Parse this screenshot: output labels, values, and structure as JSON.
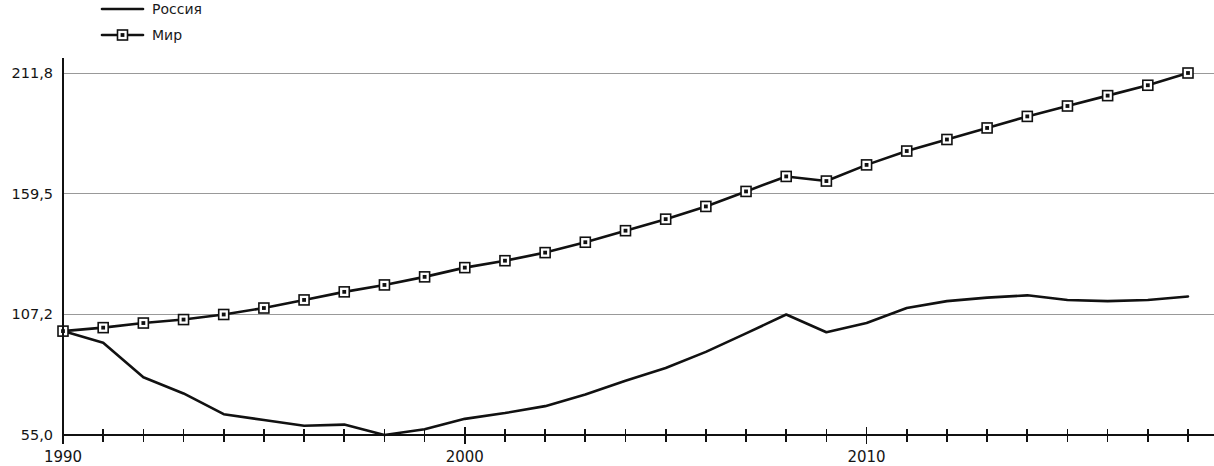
{
  "legend": {
    "position": "top-left",
    "entries": [
      {
        "label": "Россия",
        "marker": "line",
        "color": "#111111"
      },
      {
        "label": "Мир",
        "marker": "line-square",
        "color": "#111111"
      }
    ]
  },
  "axes": {
    "y_ticks": [
      "211,8",
      "159,5",
      "107,2",
      "55,0"
    ],
    "x_ticks_labeled": [
      "1990",
      "2000",
      "2010"
    ]
  },
  "chart_data": {
    "type": "line",
    "title": "",
    "subtitle": "",
    "xlabel": "",
    "ylabel": "",
    "grid": true,
    "legend_position": "top-left",
    "xlim": [
      1990,
      2018
    ],
    "ylim": [
      55.0,
      211.8
    ],
    "y_tick_values": [
      55.0,
      107.2,
      159.5,
      211.8
    ],
    "y_tick_labels": [
      "55,0",
      "107,2",
      "159,5",
      "211,8"
    ],
    "x_tick_values": [
      1990,
      1991,
      1992,
      1993,
      1994,
      1995,
      1996,
      1997,
      1998,
      1999,
      2000,
      2001,
      2002,
      2003,
      2004,
      2005,
      2006,
      2007,
      2008,
      2009,
      2010,
      2011,
      2012,
      2013,
      2014,
      2015,
      2016,
      2017,
      2018
    ],
    "x_tick_labels": {
      "1990": "1990",
      "2000": "2000",
      "2010": "2010"
    },
    "x": [
      1990,
      1991,
      1992,
      1993,
      1994,
      1995,
      1996,
      1997,
      1998,
      1999,
      2000,
      2001,
      2002,
      2003,
      2004,
      2005,
      2006,
      2007,
      2008,
      2009,
      2010,
      2011,
      2012,
      2013,
      2014,
      2015,
      2016,
      2017,
      2018
    ],
    "series": [
      {
        "name": "Россия",
        "marker": "none",
        "values": [
          100.0,
          95.0,
          80.0,
          73.0,
          64.0,
          61.5,
          59.0,
          59.5,
          55.0,
          57.5,
          62.0,
          64.5,
          67.5,
          72.5,
          78.5,
          84.0,
          91.0,
          99.0,
          107.2,
          99.5,
          103.5,
          110.0,
          113.0,
          114.5,
          115.5,
          113.5,
          113.0,
          113.5,
          115.0
        ]
      },
      {
        "name": "Мир",
        "marker": "square",
        "values": [
          100.0,
          101.5,
          103.5,
          105.0,
          107.2,
          110.0,
          113.5,
          117.0,
          120.0,
          123.5,
          127.5,
          130.5,
          134.0,
          138.5,
          143.5,
          148.5,
          154.0,
          160.5,
          167.0,
          165.0,
          172.0,
          178.0,
          183.0,
          188.0,
          193.0,
          197.5,
          202.0,
          206.5,
          211.8
        ]
      }
    ]
  }
}
